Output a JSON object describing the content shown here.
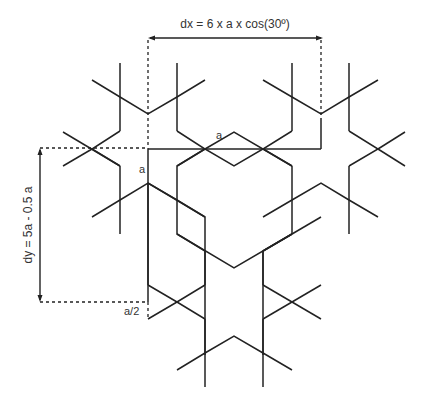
{
  "diagram": {
    "labels": {
      "dx": "dx = 6 x a x cos(30º)",
      "dy": "dy = 5a - 0.5 a",
      "a_top": "a",
      "a_left": "a",
      "a_half": "a/2"
    },
    "colors": {
      "stroke": "#222222",
      "background": "#ffffff"
    }
  }
}
